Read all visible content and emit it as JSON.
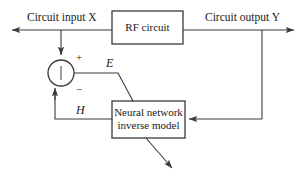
{
  "diagram": {
    "stroke_color": "#3a3a3a",
    "text_color": "#1a1a1a",
    "background": "#ffffff",
    "blocks": [
      {
        "id": "rf_circuit",
        "label": "RF circuit",
        "x": 112,
        "y": 11,
        "w": 71,
        "h": 33
      },
      {
        "id": "neural_net",
        "label_line1": "Neural network",
        "label_line2": "inverse model",
        "x": 112,
        "y": 101,
        "w": 73,
        "h": 37
      }
    ],
    "junction": {
      "id": "summing_junction",
      "cx": 61,
      "cy": 73,
      "r": 13,
      "plus_sign": "+",
      "minus_sign": "−"
    },
    "signals": {
      "input_label": "Circuit input X",
      "output_label": "Circuit output Y",
      "error_label": "E",
      "feedback_label": "H"
    }
  }
}
